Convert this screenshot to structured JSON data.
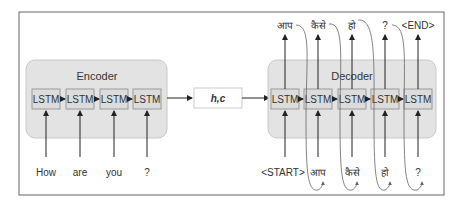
{
  "encoder": {
    "title": "Encoder",
    "cells": [
      "LSTM",
      "LSTM",
      "LSTM",
      "LSTM"
    ],
    "inputs": [
      "How",
      "are",
      "you",
      "?"
    ]
  },
  "context": {
    "label": "h,c"
  },
  "decoder": {
    "title": "Decoder",
    "cells": [
      "LSTM",
      "LSTM",
      "LSTM",
      "LSTM",
      "LSTM"
    ],
    "inputs": [
      "<START>",
      "आप",
      "कैसे",
      "हो",
      "?"
    ],
    "outputs": [
      "आप",
      "कैसे",
      "हो",
      "?",
      "<END>"
    ]
  },
  "colors": {
    "container_fill": "#e3e3e3",
    "container_stroke": "#c8c8c8",
    "cell_fill": "#dcdcdc",
    "cell_stroke": "#999999",
    "arrow": "#222222",
    "curve": "#666666"
  }
}
